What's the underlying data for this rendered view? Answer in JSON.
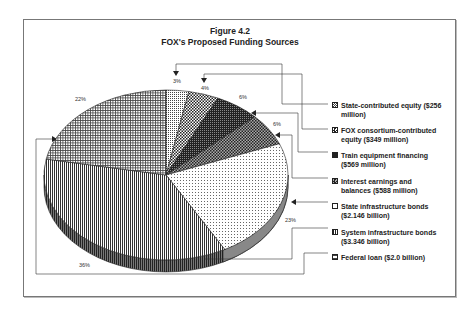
{
  "figure": {
    "number": "Figure 4.2",
    "title": "FOX's Proposed Funding Sources"
  },
  "chart_data": {
    "type": "pie",
    "title": "Figure 4.2 FOX's Proposed Funding Sources",
    "style": "3D pie, black and white hatched patterns",
    "legend_position": "right",
    "slices": [
      {
        "label": "State-contributed equity ($256 million)",
        "short": "State-contributed equity",
        "amount": "$256 million",
        "percent": 3,
        "pattern": "fine-dots"
      },
      {
        "label": "FOX consortium-contributed equity ($349 million)",
        "short": "FOX consortium-contributed equity",
        "amount": "$349 million",
        "percent": 4,
        "pattern": "checker"
      },
      {
        "label": "Train equipment financing ($569 million)",
        "short": "Train equipment financing",
        "amount": "$569 million",
        "percent": 6,
        "pattern": "dark-crosshatch"
      },
      {
        "label": "Interest earnings and balances ($588 million)",
        "short": "Interest earnings and balances",
        "amount": "$588 million",
        "percent": 6,
        "pattern": "diamond-checker"
      },
      {
        "label": "State infrastructure bonds ($2.146 billion)",
        "short": "State infrastructure bonds",
        "amount": "$2.146 billion",
        "percent": 23,
        "pattern": "sparse-dots"
      },
      {
        "label": "System infrastructure bonds ($3.346 billion)",
        "short": "System infrastructure bonds",
        "amount": "$3.346 billion",
        "percent": 36,
        "pattern": "vertical-lines"
      },
      {
        "label": "Federal loan ($2.0 billion)",
        "short": "Federal loan",
        "amount": "$2.0 billion",
        "percent": 22,
        "pattern": "grid"
      }
    ]
  },
  "pie_labels": [
    "3%",
    "4%",
    "6%",
    "6%",
    "23%",
    "36%",
    "22%"
  ],
  "legend": [
    {
      "line1": "State-contributed equity ($256",
      "line2": "million)"
    },
    {
      "line1": "FOX consortium-contributed",
      "line2": "equity ($349 million)"
    },
    {
      "line1": "Train equipment financing",
      "line2": "($569 million)"
    },
    {
      "line1": "Interest earnings and",
      "line2": "balances ($588 million)"
    },
    {
      "line1": "State infrastructure bonds",
      "line2": "($2.146 billion)"
    },
    {
      "line1": "System infrastructure bonds",
      "line2": "($3.346 billion)"
    },
    {
      "line1": "Federal loan ($2.0 billion)",
      "line2": ""
    }
  ]
}
